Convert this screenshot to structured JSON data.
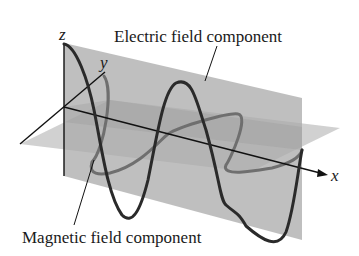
{
  "diagram": {
    "type": "electromagnetic-wave",
    "labels": {
      "electric": "Electric field component",
      "magnetic": "Magnetic field component"
    },
    "axes": {
      "x": "x",
      "y": "y",
      "z": "z"
    },
    "colors": {
      "background": "#ffffff",
      "vertical_plane": "#b4b4b4",
      "horizontal_plane": "#c8c8c8",
      "electric_wave": "#2a2a2a",
      "magnetic_wave": "#6e6e6e",
      "axis": "#111111"
    }
  }
}
